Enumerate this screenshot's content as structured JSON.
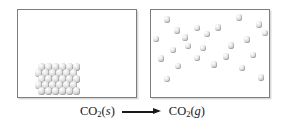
{
  "figure": {
    "background_color": "#ffffff",
    "molecule_color": "#dcdcdc",
    "border_color": "#7d7d7d",
    "text_color": "#1a1a1a"
  },
  "panels": [
    {
      "id": "solid",
      "name": "solid-container",
      "phase": "solid",
      "description": "Closed container holding solid carbon dioxide as an ordered crystal lattice resting on the floor of the box",
      "molecule_count": 30,
      "arrangement": "ordered-lattice",
      "lattice": {
        "rows": 5,
        "columns": 6
      }
    },
    {
      "id": "gas",
      "name": "gas-container",
      "phase": "gas",
      "description": "Closed container holding gaseous carbon dioxide as widely separated randomly distributed particles",
      "molecule_count": 24,
      "arrangement": "random-dispersed"
    }
  ],
  "lattice_positions": [
    [
      40.5,
      66.0
    ],
    [
      47.5,
      66.0
    ],
    [
      54.5,
      66.0
    ],
    [
      61.5,
      66.0
    ],
    [
      68.5,
      66.0
    ],
    [
      75.5,
      66.0
    ],
    [
      37.5,
      72.0
    ],
    [
      44.5,
      72.0
    ],
    [
      51.5,
      72.0
    ],
    [
      58.5,
      72.0
    ],
    [
      65.5,
      72.0
    ],
    [
      72.5,
      72.0
    ],
    [
      40.5,
      78.0
    ],
    [
      47.5,
      78.0
    ],
    [
      54.5,
      78.0
    ],
    [
      61.5,
      78.0
    ],
    [
      68.5,
      78.0
    ],
    [
      75.5,
      78.0
    ],
    [
      37.5,
      84.0
    ],
    [
      44.5,
      84.0
    ],
    [
      51.5,
      84.0
    ],
    [
      58.5,
      84.0
    ],
    [
      65.5,
      84.0
    ],
    [
      72.5,
      84.0
    ],
    [
      40.5,
      90.0
    ],
    [
      47.5,
      90.0
    ],
    [
      54.5,
      90.0
    ],
    [
      61.5,
      90.0
    ],
    [
      68.5,
      90.0
    ],
    [
      75.5,
      90.0
    ]
  ],
  "gas_positions": [
    [
      166.0,
      18.5
    ],
    [
      238.0,
      16.5
    ],
    [
      258.0,
      23.5
    ],
    [
      176.0,
      29.5
    ],
    [
      196.0,
      27.0
    ],
    [
      217.0,
      26.5
    ],
    [
      264.0,
      32.0
    ],
    [
      155.0,
      38.0
    ],
    [
      184.0,
      36.5
    ],
    [
      206.0,
      33.0
    ],
    [
      246.0,
      38.5
    ],
    [
      172.0,
      49.0
    ],
    [
      187.0,
      45.0
    ],
    [
      202.0,
      47.0
    ],
    [
      230.0,
      44.5
    ],
    [
      160.0,
      57.5
    ],
    [
      196.0,
      57.0
    ],
    [
      225.0,
      55.5
    ],
    [
      252.0,
      54.0
    ],
    [
      177.0,
      65.0
    ],
    [
      213.0,
      63.5
    ],
    [
      241.0,
      67.0
    ],
    [
      166.0,
      78.0
    ],
    [
      260.0,
      76.5
    ]
  ],
  "reaction": {
    "name": "reaction-equation",
    "full_text": "CO2(s) -> CO2(g)",
    "reactant": {
      "formula_main": "CO",
      "subscript": "2",
      "state_open": "(",
      "state_symbol": "s",
      "state_close": ")",
      "label": "CO2(s)"
    },
    "arrow": {
      "glyph": "right-arrow",
      "label": "yields"
    },
    "product": {
      "formula_main": "CO",
      "subscript": "2",
      "state_open": "(",
      "state_symbol": "g",
      "state_close": ")",
      "label": "CO2(g)"
    }
  }
}
